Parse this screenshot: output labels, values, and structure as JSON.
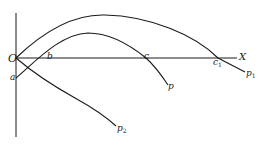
{
  "diagram": {
    "stroke_color": "#1a1a1a",
    "background": "#ffffff",
    "labels": {
      "origin": "O",
      "x_axis": "X",
      "a": "a",
      "b": "b",
      "c": "c",
      "c1_base": "c",
      "c1_sub": "1",
      "p": "p",
      "p1_base": "p",
      "p1_sub": "1",
      "p2_base": "p",
      "p2_sub": "2"
    },
    "curves": [
      {
        "name": "curve-p1",
        "from": "O",
        "to": "p1",
        "crosses_x_axis_at": "c1"
      },
      {
        "name": "curve-p",
        "from": "a",
        "to": "p",
        "crosses_x_axis_at": [
          "b",
          "c"
        ]
      },
      {
        "name": "curve-p2",
        "from": "O",
        "to": "p2"
      }
    ]
  }
}
